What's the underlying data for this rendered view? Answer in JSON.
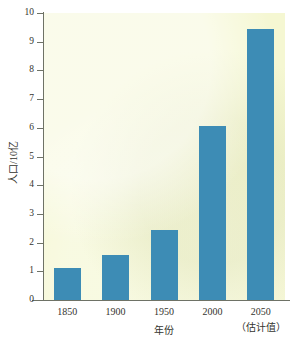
{
  "chart_data": {
    "type": "bar",
    "title": "",
    "xlabel": "年份",
    "ylabel": "人口/10亿",
    "categories": [
      "1850",
      "1900",
      "1950",
      "2000",
      "2050"
    ],
    "category_sublabels": [
      "",
      "",
      "",
      "",
      "（估计值）"
    ],
    "values": [
      1.12,
      1.57,
      2.45,
      6.05,
      9.45
    ],
    "ylim": [
      0,
      10
    ],
    "yticks": [
      "0",
      "1",
      "2",
      "3",
      "4",
      "5",
      "6",
      "7",
      "8",
      "9",
      "10"
    ],
    "grid": false,
    "legend": false,
    "bar_color": "#3d8cb5",
    "plot_background": "#f5f7d2",
    "axis_color": "#6e7266"
  }
}
